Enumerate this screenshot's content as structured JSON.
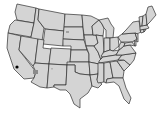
{
  "map": {
    "region": "United States (contiguous)",
    "colors": {
      "state_fill": "#d4d4d4",
      "border": "#2e2e2e",
      "highlight": "#8a8a8a",
      "marker": "#000000",
      "background": "#ffffff"
    },
    "highlights": [
      {
        "area": "Southern California / Arizona border",
        "shade": "dark"
      },
      {
        "area": "South Dakota",
        "shade": "medium"
      },
      {
        "area": "New Mexico",
        "shade": "light"
      }
    ],
    "markers": [
      {
        "area": "Southern California coast",
        "color": "#000000"
      }
    ]
  }
}
